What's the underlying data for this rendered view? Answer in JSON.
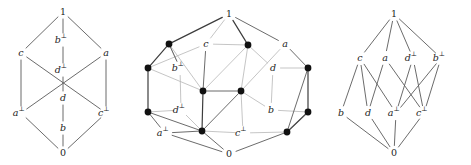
{
  "figure": {
    "background_color": "#ffffff",
    "edge_color": "#5a5a5a",
    "light_edge_color": "#b6b6b6",
    "node_color": "#111111"
  },
  "chart_data": {
    "type": "diagram",
    "subtype": "hasse-diagram-set",
    "diagrams": [
      {
        "id": "diagram-1",
        "name": "lattice-left",
        "style": "line-only",
        "nodes": [
          {
            "id": "top",
            "label": "1",
            "sup": "",
            "x": 63,
            "y": 12
          },
          {
            "id": "bperp",
            "label": "b",
            "sup": "⊥",
            "x": 63,
            "y": 40
          },
          {
            "id": "c",
            "label": "c",
            "sup": "",
            "x": 21,
            "y": 53
          },
          {
            "id": "a",
            "label": "a",
            "sup": "",
            "x": 106,
            "y": 53
          },
          {
            "id": "dperp",
            "label": "d",
            "sup": "⊥",
            "x": 63,
            "y": 70
          },
          {
            "id": "d",
            "label": "d",
            "sup": "",
            "x": 63,
            "y": 98
          },
          {
            "id": "aperp",
            "label": "a",
            "sup": "⊥",
            "x": 21,
            "y": 113
          },
          {
            "id": "cperp",
            "label": "c",
            "sup": "⊥",
            "x": 106,
            "y": 113
          },
          {
            "id": "b",
            "label": "b",
            "sup": "",
            "x": 63,
            "y": 128
          },
          {
            "id": "bot",
            "label": "0",
            "sup": "",
            "x": 63,
            "y": 153
          }
        ],
        "edges": [
          [
            "top",
            "c"
          ],
          [
            "top",
            "bperp"
          ],
          [
            "top",
            "a"
          ],
          [
            "bperp",
            "dperp"
          ],
          [
            "c",
            "aperp"
          ],
          [
            "c",
            "cperp"
          ],
          [
            "a",
            "aperp"
          ],
          [
            "a",
            "cperp"
          ],
          [
            "dperp",
            "d"
          ],
          [
            "aperp",
            "bot"
          ],
          [
            "d",
            "b"
          ],
          [
            "cperp",
            "bot"
          ],
          [
            "b",
            "bot"
          ]
        ]
      },
      {
        "id": "diagram-2",
        "name": "lattice-middle-cube",
        "style": "dots-and-labels",
        "nodes": [
          {
            "id": "top",
            "label": "1",
            "sup": "",
            "x": 89,
            "y": 14,
            "dot": false
          },
          {
            "id": "n_tl",
            "label": "",
            "sup": "",
            "x": 29,
            "y": 44,
            "dot": true
          },
          {
            "id": "c",
            "label": "c",
            "sup": "",
            "x": 66,
            "y": 44,
            "dot": false
          },
          {
            "id": "n_tc",
            "label": "",
            "sup": "",
            "x": 108,
            "y": 45,
            "dot": true
          },
          {
            "id": "a",
            "label": "a",
            "sup": "",
            "x": 145,
            "y": 44,
            "dot": false
          },
          {
            "id": "n_ml",
            "label": "",
            "sup": "",
            "x": 8,
            "y": 68,
            "dot": true
          },
          {
            "id": "bperp",
            "label": "b",
            "sup": "⊥",
            "x": 40,
            "y": 68,
            "dot": false
          },
          {
            "id": "d",
            "label": "d",
            "sup": "",
            "x": 133,
            "y": 68,
            "dot": false
          },
          {
            "id": "n_mr",
            "label": "",
            "sup": "",
            "x": 168,
            "y": 68,
            "dot": true
          },
          {
            "id": "n_cl",
            "label": "",
            "sup": "",
            "x": 63,
            "y": 91,
            "dot": true
          },
          {
            "id": "n_cr",
            "label": "",
            "sup": "",
            "x": 101,
            "y": 91,
            "dot": true
          },
          {
            "id": "n_bl",
            "label": "",
            "sup": "",
            "x": 8,
            "y": 112,
            "dot": true
          },
          {
            "id": "dperp",
            "label": "d",
            "sup": "⊥",
            "x": 41,
            "y": 110,
            "dot": false
          },
          {
            "id": "b",
            "label": "b",
            "sup": "",
            "x": 131,
            "y": 110,
            "dot": false
          },
          {
            "id": "n_br",
            "label": "",
            "sup": "",
            "x": 168,
            "y": 112,
            "dot": true
          },
          {
            "id": "aperp",
            "label": "a",
            "sup": "⊥",
            "x": 25,
            "y": 133,
            "dot": false
          },
          {
            "id": "n_bbl",
            "label": "",
            "sup": "",
            "x": 62,
            "y": 131,
            "dot": true
          },
          {
            "id": "cperp",
            "label": "c",
            "sup": "⊥",
            "x": 103,
            "y": 133,
            "dot": false
          },
          {
            "id": "n_bbr",
            "label": "",
            "sup": "",
            "x": 147,
            "y": 132,
            "dot": true
          },
          {
            "id": "bot",
            "label": "0",
            "sup": "",
            "x": 89,
            "y": 154,
            "dot": false
          }
        ]
      },
      {
        "id": "diagram-3",
        "name": "lattice-right",
        "style": "line-only",
        "nodes": [
          {
            "id": "top",
            "label": "1",
            "sup": "",
            "x": 74,
            "y": 14
          },
          {
            "id": "c",
            "label": "c",
            "sup": "",
            "x": 40,
            "y": 58
          },
          {
            "id": "a",
            "label": "a",
            "sup": "",
            "x": 65,
            "y": 58
          },
          {
            "id": "dperp",
            "label": "d",
            "sup": "⊥",
            "x": 93,
            "y": 58
          },
          {
            "id": "bperp",
            "label": "b",
            "sup": "⊥",
            "x": 121,
            "y": 58
          },
          {
            "id": "b",
            "label": "b",
            "sup": "",
            "x": 21,
            "y": 113
          },
          {
            "id": "d",
            "label": "d",
            "sup": "",
            "x": 48,
            "y": 113
          },
          {
            "id": "aperp",
            "label": "a",
            "sup": "⊥",
            "x": 76,
            "y": 113
          },
          {
            "id": "cperp",
            "label": "c",
            "sup": "⊥",
            "x": 104,
            "y": 113
          },
          {
            "id": "bot",
            "label": "0",
            "sup": "",
            "x": 74,
            "y": 153
          }
        ],
        "edges": [
          [
            "top",
            "c"
          ],
          [
            "top",
            "a"
          ],
          [
            "top",
            "dperp"
          ],
          [
            "top",
            "bperp"
          ],
          [
            "c",
            "b"
          ],
          [
            "c",
            "d"
          ],
          [
            "c",
            "aperp"
          ],
          [
            "a",
            "d"
          ],
          [
            "a",
            "cperp"
          ],
          [
            "dperp",
            "aperp"
          ],
          [
            "dperp",
            "cperp"
          ],
          [
            "bperp",
            "aperp"
          ],
          [
            "bperp",
            "cperp"
          ],
          [
            "b",
            "bot"
          ],
          [
            "d",
            "bot"
          ],
          [
            "aperp",
            "bot"
          ],
          [
            "cperp",
            "bot"
          ]
        ]
      }
    ]
  }
}
